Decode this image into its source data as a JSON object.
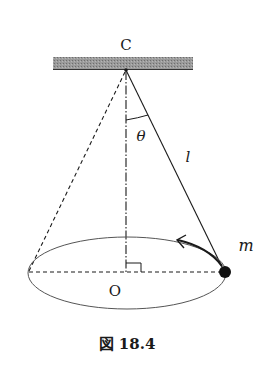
{
  "figure": {
    "caption": "図 18.4"
  },
  "labels": {
    "pivot": "C",
    "angle": "θ",
    "length": "l",
    "mass": "m",
    "center": "O"
  },
  "colors": {
    "line": "#1a1a1a",
    "ceiling": "#8a8a8a",
    "ellipse": "#555555"
  }
}
